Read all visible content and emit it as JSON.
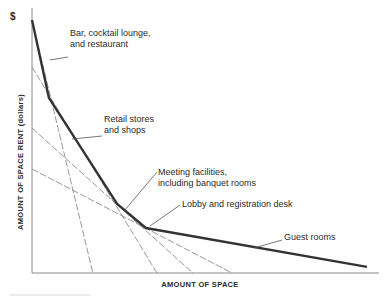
{
  "chart_data": {
    "type": "line",
    "title": "",
    "xlabel": "AMOUNT OF SPACE",
    "ylabel": "AMOUNT OF SPACE RENT (dollars)",
    "y_unit_symbol": "$",
    "xlim": [
      0,
      100
    ],
    "ylim": [
      0,
      100
    ],
    "grid": false,
    "ticks": "none",
    "series": [
      {
        "name": "Bar, cocktail lounge, and restaurant",
        "style": "dashed",
        "points": [
          [
            0,
            100
          ],
          [
            17.6,
            0
          ]
        ]
      },
      {
        "name": "Retail stores and shops",
        "style": "dashed",
        "points": [
          [
            0,
            81.4
          ],
          [
            36.1,
            0
          ]
        ]
      },
      {
        "name": "Meeting facilities, including banquet rooms",
        "style": "dashed",
        "points": [
          [
            0,
            57.3
          ],
          [
            46.5,
            0
          ]
        ]
      },
      {
        "name": "Lobby and registration desk",
        "style": "dashed",
        "points": [
          [
            0,
            41.1
          ],
          [
            57.8,
            0
          ]
        ]
      },
      {
        "name": "Rent envelope (Guest rooms segment ends)",
        "style": "bold",
        "points": [
          [
            0,
            100
          ],
          [
            4.9,
            69.2
          ],
          [
            24.6,
            27.3
          ],
          [
            32.9,
            17.8
          ],
          [
            96.8,
            2.4
          ]
        ]
      }
    ],
    "annotations": [
      {
        "lines": [
          "Bar, cocktail lounge,",
          "and restaurant"
        ],
        "points_to": [
          8.5,
          58
        ]
      },
      {
        "lines": [
          "Retail stores",
          "and shops"
        ],
        "points_to": [
          16,
          45
        ]
      },
      {
        "lines": [
          "Meeting facilities,",
          "including banquet rooms"
        ],
        "points_to": [
          26,
          25
        ]
      },
      {
        "lines": [
          "Lobby and registration desk"
        ],
        "points_to": [
          34.5,
          15.8
        ]
      },
      {
        "lines": [
          "Guest rooms"
        ],
        "points_to": [
          66,
          9
        ]
      }
    ]
  }
}
